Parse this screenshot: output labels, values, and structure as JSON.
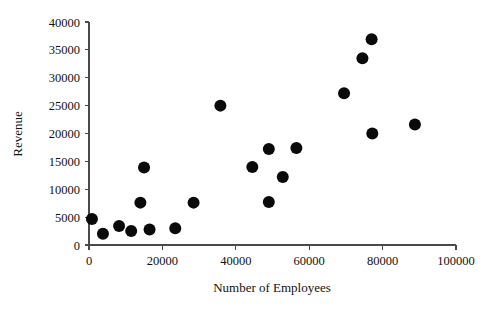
{
  "chart_data": {
    "type": "scatter",
    "title": "",
    "xlabel": "Number of Employees",
    "ylabel": "Revenue",
    "xlim": [
      0,
      100000
    ],
    "ylim": [
      0,
      40000
    ],
    "grid": false,
    "legend": null,
    "marker": {
      "shape": "circle",
      "color": "#0a0a0a",
      "size": 6
    },
    "xticks": [
      0,
      20000,
      40000,
      60000,
      80000,
      100000
    ],
    "xtick_labels": [
      "0",
      "20000",
      "40000",
      "60000",
      "80000",
      "100000"
    ],
    "yticks": [
      0,
      5000,
      10000,
      15000,
      20000,
      25000,
      30000,
      35000,
      40000
    ],
    "ytick_labels": [
      "0",
      "5000",
      "10000",
      "15000",
      "20000",
      "25000",
      "30000",
      "35000",
      "40000"
    ],
    "points": [
      {
        "x": 800,
        "y": 4650
      },
      {
        "x": 3800,
        "y": 2000
      },
      {
        "x": 8200,
        "y": 3400
      },
      {
        "x": 11500,
        "y": 2500
      },
      {
        "x": 14000,
        "y": 7600
      },
      {
        "x": 15000,
        "y": 13900
      },
      {
        "x": 16500,
        "y": 2800
      },
      {
        "x": 23500,
        "y": 3000
      },
      {
        "x": 28500,
        "y": 7600
      },
      {
        "x": 35800,
        "y": 25000
      },
      {
        "x": 44500,
        "y": 14000
      },
      {
        "x": 49000,
        "y": 17200
      },
      {
        "x": 49000,
        "y": 7700
      },
      {
        "x": 52800,
        "y": 12200
      },
      {
        "x": 56500,
        "y": 17400
      },
      {
        "x": 69500,
        "y": 27200
      },
      {
        "x": 74500,
        "y": 33500
      },
      {
        "x": 77000,
        "y": 36900
      },
      {
        "x": 77200,
        "y": 20000
      },
      {
        "x": 88800,
        "y": 21600
      }
    ]
  },
  "axes": {
    "x_title": "Number of Employees",
    "y_title": "Revenue"
  }
}
